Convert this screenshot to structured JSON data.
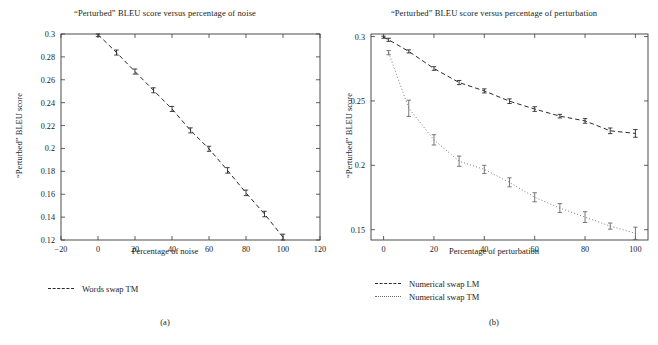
{
  "figure": {
    "panels": [
      {
        "id": "a",
        "caption": "(a)",
        "title": "“Perturbed” BLEU score versus percentage of noise",
        "xlabel": "Percentage of noise",
        "ylabel": "“Perturbed” BLEU score",
        "legend": [
          {
            "label": "Words swap TM",
            "style": "dashed",
            "color": "#2a2a2a"
          }
        ]
      },
      {
        "id": "b",
        "caption": "(b)",
        "title": "“Perturbed” BLEU score versus percentage of perturbation",
        "xlabel": "Percentage of perturbation",
        "ylabel": "“Perturbed” BLEU score",
        "legend": [
          {
            "label": "Numerical swap LM",
            "style": "dashed",
            "color": "#2a2a2a"
          },
          {
            "label": "Numerical swap TM",
            "style": "dotted",
            "color": "#6a6a6a"
          }
        ]
      }
    ]
  },
  "chart_data": [
    {
      "type": "line",
      "panel": "a",
      "title": "“Perturbed” BLEU score versus percentage of noise",
      "xlabel": "Percentage of noise",
      "ylabel": "“Perturbed” BLEU score",
      "xlim": [
        -20,
        120
      ],
      "ylim": [
        0.12,
        0.3
      ],
      "xticks": [
        -20,
        0,
        20,
        40,
        60,
        80,
        100,
        120
      ],
      "yticks": [
        0.12,
        0.14,
        0.16,
        0.18,
        0.2,
        0.22,
        0.24,
        0.26,
        0.28,
        0.3
      ],
      "grid": false,
      "legend_position": "below-left",
      "errorbars": true,
      "series": [
        {
          "name": "Words swap TM",
          "style": "dashed",
          "color": "#2a2a2a",
          "x": [
            0,
            10,
            20,
            30,
            40,
            50,
            60,
            70,
            80,
            90,
            100
          ],
          "values": [
            0.2995,
            0.2838,
            0.2672,
            0.2508,
            0.2345,
            0.2158,
            0.1997,
            0.1808,
            0.1612,
            0.1427,
            0.1225
          ],
          "yerr": [
            0.0018,
            0.0022,
            0.0022,
            0.0022,
            0.0022,
            0.0022,
            0.0022,
            0.0024,
            0.0024,
            0.0024,
            0.0026
          ]
        }
      ]
    },
    {
      "type": "line",
      "panel": "b",
      "title": "“Perturbed” BLEU score versus percentage of perturbation",
      "xlabel": "Percentage of perturbation",
      "ylabel": "“Perturbed” BLEU score",
      "xlim": [
        -5,
        105
      ],
      "ylim": [
        0.142,
        0.302
      ],
      "xticks": [
        0,
        20,
        40,
        60,
        80,
        100
      ],
      "yticks": [
        0.15,
        0.2,
        0.25,
        0.3
      ],
      "grid": false,
      "legend_position": "below-left",
      "errorbars": true,
      "series": [
        {
          "name": "Numerical swap LM",
          "style": "dashed",
          "color": "#2a2a2a",
          "x": [
            0,
            2,
            10,
            20,
            30,
            40,
            50,
            60,
            70,
            80,
            90,
            100
          ],
          "values": [
            0.2995,
            0.2975,
            0.2885,
            0.2752,
            0.2643,
            0.2578,
            0.2498,
            0.2437,
            0.2382,
            0.2345,
            0.2268,
            0.2248
          ],
          "yerr": [
            0.0008,
            0.0012,
            0.0012,
            0.0014,
            0.0016,
            0.0016,
            0.0018,
            0.0018,
            0.0014,
            0.0018,
            0.0022,
            0.003
          ]
        },
        {
          "name": "Numerical swap TM",
          "style": "dotted",
          "color": "#6a6a6a",
          "x": [
            2,
            10,
            20,
            30,
            40,
            50,
            60,
            70,
            80,
            90,
            100
          ],
          "values": [
            0.2875,
            0.2443,
            0.2198,
            0.2032,
            0.1968,
            0.1868,
            0.1752,
            0.1668,
            0.1598,
            0.1528,
            0.1472
          ],
          "yerr": [
            0.0016,
            0.0063,
            0.004,
            0.004,
            0.0032,
            0.0035,
            0.0035,
            0.0035,
            0.0042,
            0.0024,
            0.0048
          ]
        }
      ]
    }
  ]
}
